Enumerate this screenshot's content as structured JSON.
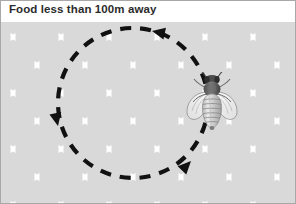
{
  "figure": {
    "caption": "Food less than 100m away",
    "kind": "bee-round-dance-diagram",
    "width": 296,
    "height": 204
  },
  "colors": {
    "comb_cell": "#d9d9d9",
    "comb_cell_shade": "#cfcfcf",
    "comb_wall": "#ffffff",
    "background": "#ffffff",
    "frame_border": "#a8a8a8",
    "caption_text": "#2b2b2b",
    "path_stroke": "#111111",
    "bee_body_dark": "#5f5f5f",
    "bee_body_light": "#d2d2d2",
    "bee_wing": "#f2f2f2",
    "bee_outline": "#8a8a8a"
  },
  "comb": {
    "label": "honeycomb-background",
    "orientation": "pointy-top",
    "cell_width": 48,
    "cell_height": 56,
    "wall_width": 4,
    "columns": 7,
    "rows": 5
  },
  "dance_path": {
    "label": "round-dance-circular-path",
    "shape": "circle",
    "center_x": 133,
    "center_y": 103,
    "radius": 75,
    "dash_length": 11,
    "dash_gap": 9,
    "stroke_width": 4.2,
    "direction": "counter-clockwise",
    "arrowheads": [
      {
        "name": "arrowhead-top",
        "x": 152,
        "y": 31,
        "rotation": 192
      },
      {
        "name": "arrowhead-left",
        "x": 58,
        "y": 126,
        "rotation": 78
      },
      {
        "name": "arrowhead-bottom-right",
        "x": 190,
        "y": 161,
        "rotation": 315
      }
    ]
  },
  "bee": {
    "label": "honey-bee-top-view",
    "x": 211,
    "y": 103,
    "parts": [
      {
        "name": "bee-head",
        "description": "dark head with antennae"
      },
      {
        "name": "bee-thorax",
        "description": "dark furry thorax"
      },
      {
        "name": "bee-wing-left",
        "description": "translucent outlined wing"
      },
      {
        "name": "bee-wing-right",
        "description": "translucent outlined wing"
      },
      {
        "name": "bee-abdomen",
        "description": "striped tapering abdomen"
      }
    ],
    "abdomen_stripes": 7
  }
}
